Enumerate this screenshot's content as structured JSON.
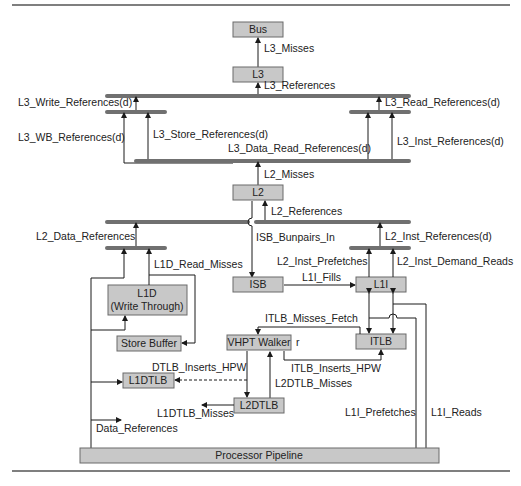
{
  "diagram": {
    "boxes": {
      "bus": "Bus",
      "l3": "L3",
      "l2": "L2",
      "l1d_line1": "L1D",
      "l1d_line2": "(Write Through)",
      "store_buffer": "Store Buffer",
      "isb": "ISB",
      "l1i": "L1I",
      "vhpt_walker": "VHPT Walker",
      "itlb": "ITLB",
      "l1dtlb": "L1DTLB",
      "l2dtlb": "L2DTLB",
      "processor_pipeline": "Processor Pipeline"
    },
    "labels": {
      "l3_misses": "L3_Misses",
      "l3_references": "L3_References",
      "l3_write_references": "L3_Write_References(d)",
      "l3_read_references": "L3_Read_References(d)",
      "l3_wb_references": "L3_WB_References(d)",
      "l3_store_references": "L3_Store_References(d)",
      "l3_data_read_references": "L3_Data_Read_References(d)",
      "l3_inst_references": "L3_Inst_References(d)",
      "l2_misses": "L2_Misses",
      "l2_references": "L2_References",
      "l2_data_references": "L2_Data_References",
      "isb_bunpairs_in": "ISB_Bunpairs_In",
      "l2_inst_references": "L2_Inst_References(d)",
      "l1d_read_misses": "L1D_Read_Misses",
      "l2_inst_prefetches": "L2_Inst_Prefetches",
      "l2_inst_demand_reads": "L2_Inst_Demand_Reads",
      "l1i_fills": "L1I_Fills",
      "itlb_misses_fetch": "ITLB_Misses_Fetch",
      "r": "r",
      "dtlb_inserts_hpw": "DTLB_Inserts_HPW",
      "itlb_inserts_hpw": "ITLB_Inserts_HPW",
      "l2dtlb_misses": "L2DTLB_Misses",
      "l1dtlb_misses": "L1DTLB_Misses",
      "data_references": "Data_References",
      "l1i_prefetches": "L1I_Prefetches",
      "l1i_reads": "L1I_Reads"
    },
    "colors": {
      "box_fill": "#c8c8c8",
      "bus_bar": "#707070",
      "line": "#1a1a1a"
    }
  }
}
